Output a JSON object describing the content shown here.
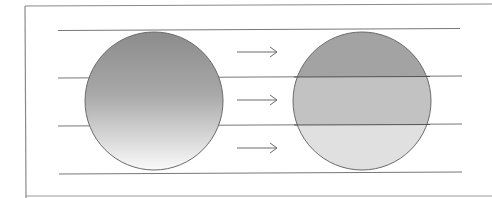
{
  "diagram": {
    "colors": {
      "frame": "#8a8a8a",
      "line": "#6e6e6e",
      "gradient_top": "#8c8c8c",
      "gradient_bottom": "#f8f8f8",
      "band_top": "#a3a3a3",
      "band_middle": "#c2c2c2",
      "band_bottom": "#e0e0e0",
      "arrow": "#6a6a6a"
    },
    "horizontal_lines_y": [
      30,
      77,
      125,
      173
    ],
    "left_circle": {
      "cx": 154,
      "cy": 101,
      "r": 69,
      "fill": "gradient"
    },
    "right_circle": {
      "cx": 362,
      "cy": 101,
      "r": 69,
      "fill": "banded",
      "bands": 3
    },
    "arrows": [
      {
        "y": 52,
        "direction": "right"
      },
      {
        "y": 100,
        "direction": "right"
      },
      {
        "y": 148,
        "direction": "right"
      }
    ]
  }
}
